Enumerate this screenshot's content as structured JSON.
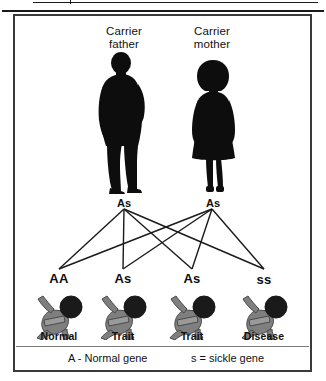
{
  "figure": {
    "title_father": {
      "line1": "Carrier",
      "line2": "father"
    },
    "title_mother": {
      "line1": "Carrier",
      "line2": "mother"
    },
    "parents": [
      {
        "role": "father",
        "genotype": "As",
        "icon": "man-silhouette-icon"
      },
      {
        "role": "mother",
        "genotype": "As",
        "icon": "woman-silhouette-icon"
      }
    ],
    "children": [
      {
        "genotype": "AA",
        "caption": "Normal",
        "icon": "baby-silhouette-icon"
      },
      {
        "genotype": "As",
        "caption": "Trait",
        "icon": "baby-silhouette-icon"
      },
      {
        "genotype": "As",
        "caption": "Trait",
        "icon": "baby-silhouette-icon"
      },
      {
        "genotype": "ss",
        "caption": "Disease",
        "icon": "baby-silhouette-icon"
      }
    ],
    "legend": [
      {
        "symbol": "A",
        "separator": "-",
        "text": "Normal gene",
        "full": "A  -  Normal gene"
      },
      {
        "symbol": "s",
        "separator": "=",
        "text": "sickle gene",
        "full": "s  =  sickle gene"
      }
    ],
    "colors": {
      "silhouette": "#0d0d0d",
      "baby_body": "#7f7f7f",
      "baby_head": "#1a1a1a",
      "baby_outline": "#4a4a4a",
      "frame": "#3a3a3a",
      "line": "#1a1a1a",
      "background": "#ffffff"
    }
  }
}
